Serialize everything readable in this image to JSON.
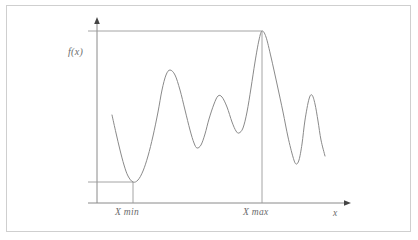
{
  "figure": {
    "type": "function-plot-diagram",
    "background_color": "#ffffff",
    "border_color": "#cfcfcf",
    "curve_color": "#8a8a8a",
    "axis_color": "#8a8a8a",
    "guide_color": "#9a9a9a",
    "label_color": "#6b6b6b"
  },
  "labels": {
    "y_axis": "f(x)",
    "x_axis": "x",
    "x_min": "X min",
    "x_max": "X max"
  },
  "chart_data": {
    "type": "line",
    "title": "",
    "xlabel": "x",
    "ylabel": "f(x)",
    "grid": false,
    "legend": false,
    "axis_origin_px": [
      97,
      203
    ],
    "annotations": [
      {
        "name": "x-min",
        "label": "X min",
        "x_px": 133,
        "y_px": 182,
        "guide": "horizontal-from-y-axis-and-vertical-to-x-axis"
      },
      {
        "name": "x-max",
        "label": "X max",
        "x_px": 262,
        "y_px": 31,
        "guide": "horizontal-from-y-axis-and-vertical-to-x-axis"
      }
    ],
    "curve_points_px": [
      [
        112,
        115
      ],
      [
        116,
        133
      ],
      [
        120,
        150
      ],
      [
        124,
        165
      ],
      [
        128,
        176
      ],
      [
        133,
        182
      ],
      [
        138,
        180
      ],
      [
        143,
        171
      ],
      [
        148,
        156
      ],
      [
        153,
        136
      ],
      [
        158,
        112
      ],
      [
        162,
        90
      ],
      [
        166,
        75
      ],
      [
        170,
        70
      ],
      [
        175,
        75
      ],
      [
        180,
        90
      ],
      [
        185,
        110
      ],
      [
        190,
        130
      ],
      [
        194,
        143
      ],
      [
        197,
        148
      ],
      [
        201,
        145
      ],
      [
        205,
        134
      ],
      [
        209,
        119
      ],
      [
        214,
        104
      ],
      [
        218,
        96
      ],
      [
        222,
        97
      ],
      [
        227,
        107
      ],
      [
        232,
        122
      ],
      [
        236,
        131
      ],
      [
        239,
        133
      ],
      [
        243,
        128
      ],
      [
        247,
        112
      ],
      [
        251,
        88
      ],
      [
        255,
        62
      ],
      [
        259,
        40
      ],
      [
        262,
        31
      ],
      [
        266,
        37
      ],
      [
        271,
        57
      ],
      [
        277,
        84
      ],
      [
        283,
        112
      ],
      [
        288,
        137
      ],
      [
        293,
        157
      ],
      [
        296,
        164
      ],
      [
        299,
        160
      ],
      [
        302,
        144
      ],
      [
        305,
        120
      ],
      [
        309,
        99
      ],
      [
        312,
        95
      ],
      [
        315,
        104
      ],
      [
        318,
        121
      ],
      [
        321,
        140
      ],
      [
        325,
        156
      ]
    ]
  }
}
